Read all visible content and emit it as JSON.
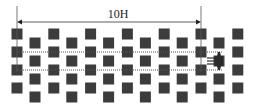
{
  "diagram": {
    "dimension_label": "10H",
    "colors": {
      "element": "#3c3c3c",
      "line": "#444444",
      "background": "#ffffff"
    },
    "array": {
      "type": "staggered-grid",
      "column_sets": [
        {
          "name": "primary-columns",
          "count": 7,
          "rows": 4
        },
        {
          "name": "offset-columns",
          "count": 6,
          "rows": 4
        }
      ]
    },
    "measurement_lines": [
      {
        "name": "dotted-line-upper",
        "style": "dotted"
      },
      {
        "name": "dotted-line-lower",
        "style": "dotted"
      }
    ],
    "probe": {
      "name": "probe-icon"
    }
  }
}
